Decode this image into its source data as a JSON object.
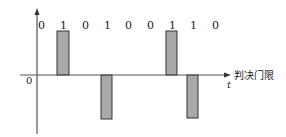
{
  "diagram": {
    "bits": [
      "0",
      "1",
      "0",
      "1",
      "0",
      "0",
      "1",
      "1",
      "0"
    ],
    "bit_x": [
      41,
      63,
      85,
      107,
      128,
      150,
      172,
      193,
      215
    ],
    "origin_label": "0",
    "time_label": "t",
    "threshold_label": "判决门限",
    "bars": [
      {
        "x": 57,
        "w": 12,
        "y": 31,
        "h": 44
      },
      {
        "x": 101,
        "w": 11,
        "y": 75,
        "h": 44
      },
      {
        "x": 166,
        "w": 11,
        "y": 31,
        "h": 44
      },
      {
        "x": 187,
        "w": 11,
        "y": 75,
        "h": 43
      }
    ],
    "colors": {
      "bar_fill": "#a9a9a9",
      "stroke": "#333333"
    }
  }
}
